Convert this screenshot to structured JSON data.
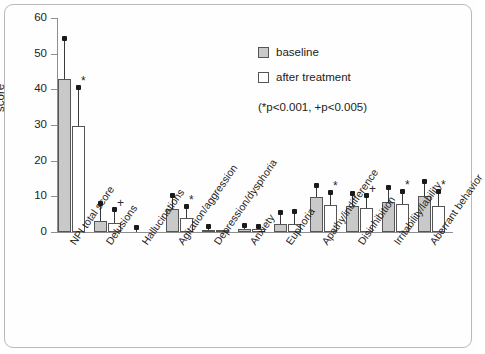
{
  "axis": {
    "y_title": "score",
    "y_ticks": [
      0,
      10,
      20,
      30,
      40,
      50,
      60
    ],
    "y_min": 0,
    "y_max": 60
  },
  "legend": {
    "items": [
      {
        "label": "baseline",
        "swatch": "baseline",
        "color": "#c9c9c9"
      },
      {
        "label": "after treatment",
        "swatch": "after",
        "color": "#ffffff"
      }
    ]
  },
  "pvalue_note": "(*p<0.001, +p<0.005)",
  "chart_data": {
    "type": "bar",
    "title": "",
    "xlabel": "",
    "ylabel": "score",
    "ylim": [
      0,
      60
    ],
    "grid": false,
    "legend_position": "upper-right",
    "categories": [
      "NPI total score",
      "Delusions",
      "Hallucinations",
      "Agitation/aggression",
      "Depression/dysphoria",
      "Anxiety",
      "Euphoria",
      "Apathy/indifference",
      "Disinhibition",
      "Irritability/lability",
      "Aberrant behavior"
    ],
    "series": [
      {
        "name": "baseline",
        "color": "#c9c9c9",
        "values": [
          43.0,
          3.2,
          0.0,
          6.4,
          0.5,
          0.8,
          2.3,
          9.7,
          7.3,
          8.4,
          10.2
        ],
        "errors_upper": [
          54.0,
          7.8,
          1.2,
          10.2,
          1.4,
          1.6,
          5.4,
          13.0,
          10.7,
          12.4,
          14.0
        ],
        "significance": [
          "",
          "",
          "",
          "",
          "",
          "",
          "",
          "",
          "",
          "",
          ""
        ]
      },
      {
        "name": "after treatment",
        "color": "#ffffff",
        "values": [
          29.6,
          2.4,
          0.0,
          3.9,
          0.2,
          0.8,
          2.2,
          7.6,
          6.7,
          7.8,
          7.3
        ],
        "errors_upper": [
          40.3,
          6.1,
          0.0,
          7.0,
          0.0,
          1.5,
          5.5,
          11.0,
          10.1,
          11.2,
          11.3
        ],
        "significance": [
          "*",
          "+",
          "",
          "*",
          "",
          "",
          "",
          "*",
          "+",
          "*",
          "*"
        ]
      }
    ]
  }
}
